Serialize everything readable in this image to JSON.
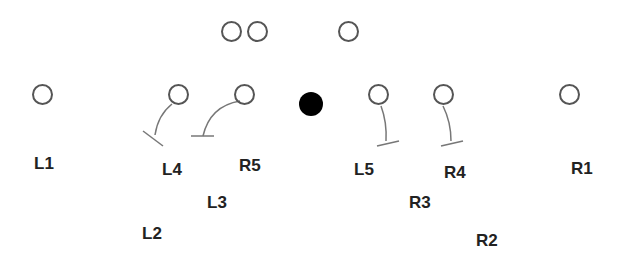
{
  "diagram": {
    "type": "football-play-diagram",
    "colors": {
      "player_stroke": "#555555",
      "ball_fill": "#000000",
      "route_stroke": "#777777",
      "label": "#222222"
    },
    "backfield": [
      {
        "id": "back-1",
        "x": 231,
        "y": 31
      },
      {
        "id": "back-2",
        "x": 257,
        "y": 31
      },
      {
        "id": "back-3",
        "x": 348,
        "y": 31
      }
    ],
    "line": [
      {
        "id": "line-1",
        "x": 42,
        "y": 94
      },
      {
        "id": "line-2",
        "x": 178,
        "y": 94
      },
      {
        "id": "line-3",
        "x": 244,
        "y": 94
      },
      {
        "id": "line-4",
        "x": 378,
        "y": 94
      },
      {
        "id": "line-5",
        "x": 443,
        "y": 94
      },
      {
        "id": "line-6",
        "x": 569,
        "y": 94
      }
    ],
    "ball": {
      "x": 311,
      "y": 104
    },
    "labels": [
      {
        "text": "L1",
        "x": 34,
        "y": 155
      },
      {
        "text": "L4",
        "x": 162,
        "y": 161
      },
      {
        "text": "R5",
        "x": 239,
        "y": 157
      },
      {
        "text": "L3",
        "x": 207,
        "y": 194
      },
      {
        "text": "L2",
        "x": 142,
        "y": 225
      },
      {
        "text": "L5",
        "x": 354,
        "y": 161
      },
      {
        "text": "R4",
        "x": 444,
        "y": 164
      },
      {
        "text": "R3",
        "x": 409,
        "y": 194
      },
      {
        "text": "R2",
        "x": 476,
        "y": 232
      },
      {
        "text": "R1",
        "x": 571,
        "y": 160
      }
    ],
    "blocks": [
      {
        "from": "line-2",
        "path": "M172 104 Q158 115 155 135",
        "bar": [
          143,
          131,
          163,
          146
        ]
      },
      {
        "from": "line-3",
        "path": "M240 101 Q210 106 203 136",
        "bar": [
          191,
          136,
          214,
          136
        ]
      },
      {
        "from": "line-4",
        "path": "M381 106 Q387 122 386 141",
        "bar": [
          377,
          146,
          399,
          141
        ]
      },
      {
        "from": "line-5",
        "path": "M443 106 Q451 122 451 141",
        "bar": [
          441,
          146,
          463,
          141
        ]
      }
    ]
  }
}
